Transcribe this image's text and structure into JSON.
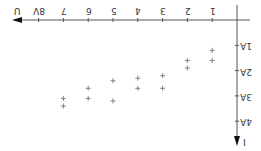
{
  "chart_data": {
    "type": "scatter",
    "title": "",
    "orientation_note": "image rotated 180 degrees",
    "xlabel": "U",
    "ylabel": "I",
    "x_ticks": [
      "1",
      "2",
      "3",
      "4",
      "5",
      "6",
      "7",
      "8V"
    ],
    "y_ticks": [
      "1A",
      "2A",
      "3A",
      "4A"
    ],
    "xlim": [
      0,
      8.4
    ],
    "ylim": [
      0,
      4.3
    ],
    "grid": false,
    "marker": "+",
    "points": [
      {
        "x": 1,
        "y": 1.2
      },
      {
        "x": 1,
        "y": 1.6
      },
      {
        "x": 2,
        "y": 1.6
      },
      {
        "x": 2,
        "y": 1.9
      },
      {
        "x": 3,
        "y": 2.2
      },
      {
        "x": 3,
        "y": 2.7
      },
      {
        "x": 4,
        "y": 2.3
      },
      {
        "x": 4,
        "y": 2.7
      },
      {
        "x": 5,
        "y": 2.4
      },
      {
        "x": 5,
        "y": 3.2
      },
      {
        "x": 6,
        "y": 2.7
      },
      {
        "x": 6,
        "y": 3.1
      },
      {
        "x": 7,
        "y": 3.1
      },
      {
        "x": 7,
        "y": 3.4
      }
    ],
    "colors": {
      "axis": "#555555",
      "marker": "#777777",
      "text": "#333333"
    }
  }
}
